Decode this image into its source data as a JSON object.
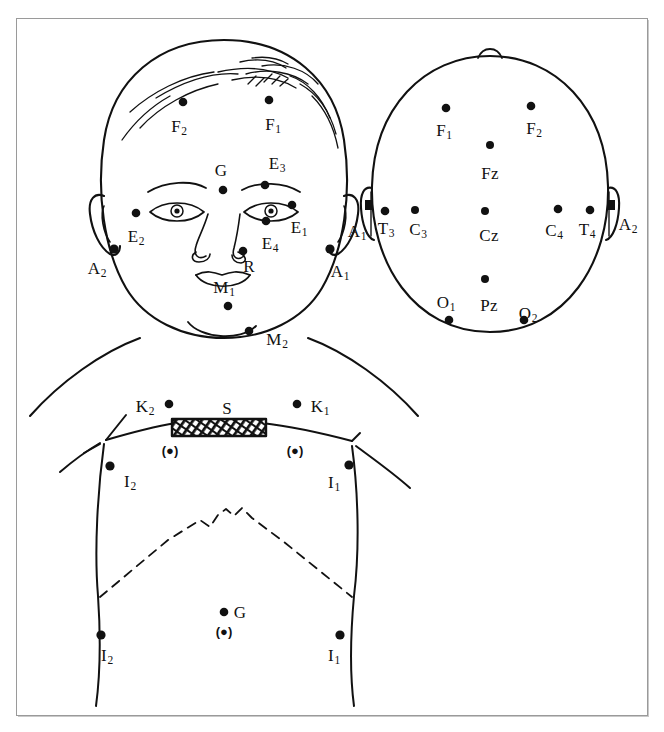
{
  "figure": {
    "background_color": "#ffffff",
    "ink_color": "#111111",
    "frame_color": "#9a9a9a",
    "width": 664,
    "height": 732
  },
  "panels": {
    "face": {
      "name": "infant-face-front-view",
      "electrodes": [
        {
          "id": "F2-face",
          "label": "F",
          "sub": "2",
          "dot": [
            183,
            102
          ],
          "text": [
            179,
            126
          ]
        },
        {
          "id": "F1-face",
          "label": "F",
          "sub": "1",
          "dot": [
            269,
            100
          ],
          "text": [
            273,
            124
          ]
        },
        {
          "id": "E3",
          "label": "E",
          "sub": "3",
          "dot": [
            265,
            185
          ],
          "text": [
            277,
            163
          ]
        },
        {
          "id": "G-face",
          "label": "G",
          "sub": "",
          "dot": [
            223,
            190
          ],
          "text": [
            221,
            170
          ]
        },
        {
          "id": "E1",
          "label": "E",
          "sub": "1",
          "dot": [
            292,
            205
          ],
          "text": [
            299,
            227
          ]
        },
        {
          "id": "E2",
          "label": "E",
          "sub": "2",
          "dot": [
            136,
            213
          ],
          "text": [
            136,
            236
          ]
        },
        {
          "id": "E4",
          "label": "E",
          "sub": "4",
          "dot": [
            266,
            221
          ],
          "text": [
            270,
            243
          ]
        },
        {
          "id": "R",
          "label": "R",
          "sub": "",
          "dot": [
            243,
            251
          ],
          "text": [
            249,
            266
          ]
        },
        {
          "id": "A2-face",
          "label": "A",
          "sub": "2",
          "dot": [
            114,
            249
          ],
          "text": [
            97,
            268
          ]
        },
        {
          "id": "A1-face",
          "label": "A",
          "sub": "1",
          "dot": [
            330,
            249
          ],
          "text": [
            340,
            271
          ]
        },
        {
          "id": "M1",
          "label": "M",
          "sub": "1",
          "dot": [
            228,
            306
          ],
          "text": [
            224,
            287
          ]
        },
        {
          "id": "M2",
          "label": "M",
          "sub": "2",
          "dot": [
            249,
            331
          ],
          "text": [
            277,
            339
          ]
        }
      ]
    },
    "head_top": {
      "name": "head-top-view",
      "electrodes": [
        {
          "id": "F1-head",
          "label": "F",
          "sub": "1",
          "dot": [
            446,
            108
          ],
          "text": [
            444,
            130
          ]
        },
        {
          "id": "F2-head",
          "label": "F",
          "sub": "2",
          "dot": [
            531,
            106
          ],
          "text": [
            534,
            128
          ]
        },
        {
          "id": "Fz",
          "label": "Fz",
          "sub": "",
          "dot": [
            490,
            145
          ],
          "text": [
            490,
            173
          ]
        },
        {
          "id": "T3",
          "label": "T",
          "sub": "3",
          "dot": [
            385,
            211
          ],
          "text": [
            386,
            228
          ]
        },
        {
          "id": "C3",
          "label": "C",
          "sub": "3",
          "dot": [
            415,
            210
          ],
          "text": [
            418,
            229
          ]
        },
        {
          "id": "Cz",
          "label": "Cz",
          "sub": "",
          "dot": [
            485,
            211
          ],
          "text": [
            489,
            235
          ]
        },
        {
          "id": "C4",
          "label": "C",
          "sub": "4",
          "dot": [
            558,
            209
          ],
          "text": [
            554,
            230
          ]
        },
        {
          "id": "T4",
          "label": "T",
          "sub": "4",
          "dot": [
            590,
            210
          ],
          "text": [
            587,
            229
          ]
        },
        {
          "id": "A1-head",
          "label": "A",
          "sub": "1",
          "dot": [
            370,
            212
          ],
          "text": [
            357,
            231
          ]
        },
        {
          "id": "A2-head",
          "label": "A",
          "sub": "2",
          "dot": [
            610,
            212
          ],
          "text": [
            628,
            224
          ]
        },
        {
          "id": "Pz",
          "label": "Pz",
          "sub": "",
          "dot": [
            485,
            279
          ],
          "text": [
            489,
            305
          ]
        },
        {
          "id": "O1",
          "label": "O",
          "sub": "1",
          "dot": [
            449,
            320
          ],
          "text": [
            446,
            302
          ]
        },
        {
          "id": "O2",
          "label": "O",
          "sub": "2",
          "dot": [
            524,
            320
          ],
          "text": [
            528,
            313
          ]
        }
      ]
    },
    "torso": {
      "name": "infant-torso-front-view",
      "sensor_bar": {
        "id": "S-bar",
        "label": "S",
        "text": [
          227,
          408
        ],
        "rect": [
          172,
          419,
          94,
          17
        ]
      },
      "electrodes": [
        {
          "id": "K2",
          "label": "K",
          "sub": "2",
          "dot": [
            169,
            404
          ],
          "text": [
            145,
            406
          ]
        },
        {
          "id": "K1",
          "label": "K",
          "sub": "1",
          "dot": [
            297,
            404
          ],
          "text": [
            320,
            406
          ]
        },
        {
          "id": "I2-upper",
          "label": "I",
          "sub": "2",
          "dot": [
            110,
            466
          ],
          "text": [
            130,
            481
          ]
        },
        {
          "id": "I1-upper",
          "label": "I",
          "sub": "1",
          "dot": [
            349,
            465
          ],
          "text": [
            334,
            482
          ]
        },
        {
          "id": "G-torso",
          "label": "G",
          "sub": "",
          "dot": [
            224,
            612
          ],
          "text": [
            240,
            612
          ]
        },
        {
          "id": "I2-lower",
          "label": "I",
          "sub": "2",
          "dot": [
            101,
            635
          ],
          "text": [
            107,
            655
          ]
        },
        {
          "id": "I1-lower",
          "label": "I",
          "sub": "1",
          "dot": [
            340,
            635
          ],
          "text": [
            334,
            655
          ]
        }
      ],
      "reference_markers": [
        {
          "id": "ref-left-clavicle",
          "label": "(●)",
          "text": [
            170,
            450
          ]
        },
        {
          "id": "ref-right-clavicle",
          "label": "(●)",
          "text": [
            295,
            450
          ]
        },
        {
          "id": "ref-abdomen",
          "label": "(●)",
          "text": [
            224,
            631
          ]
        }
      ]
    }
  }
}
